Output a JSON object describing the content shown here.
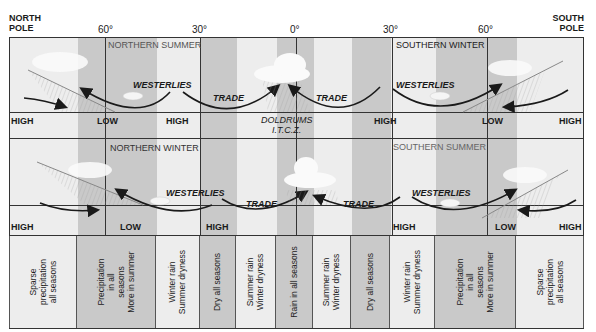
{
  "header": {
    "north_pole": "NORTH\nPOLE",
    "south_pole": "SOUTH\nPOLE",
    "latitudes": [
      "60°",
      "30°",
      "0°",
      "30°",
      "60°"
    ]
  },
  "top_panel": {
    "season_left": "NORTHERN SUMMER",
    "season_right": "SOUTHERN WINTER",
    "winds": [
      "WESTERLIES",
      "TRADE",
      "TRADE",
      "WESTERLIES"
    ]
  },
  "top_pressure_row": {
    "labels": [
      "HIGH",
      "LOW",
      "HIGH",
      "HIGH",
      "LOW",
      "HIGH"
    ],
    "doldrums": "DOLDRUMS",
    "itcz": "I.T.C.Z."
  },
  "bottom_panel": {
    "season_left": "NORTHERN WINTER",
    "season_right": "SOUTHERN SUMMER",
    "winds": [
      "WESTERLIES",
      "TRADE",
      "TRADE",
      "WESTERLIES"
    ]
  },
  "bottom_pressure_row": {
    "labels": [
      "HIGH",
      "LOW",
      "HIGH",
      "HIGH",
      "LOW",
      "HIGH"
    ]
  },
  "precipitation_zones": [
    {
      "text": "Sparse\nprecipitation\nall seasons",
      "shade": "light"
    },
    {
      "text": "Precipitation\nin all\nseasons\nMore in summer",
      "shade": "dark"
    },
    {
      "text": "Winter rain\nSummer dryness",
      "shade": "light"
    },
    {
      "text": "Dry all seasons",
      "shade": "dark"
    },
    {
      "text": "Summer rain\nWinter dryness",
      "shade": "light"
    },
    {
      "text": "Rain in all seasons",
      "shade": "dark"
    },
    {
      "text": "Summer rain\nWinter dryness",
      "shade": "light"
    },
    {
      "text": "Dry all seasons",
      "shade": "dark"
    },
    {
      "text": "Winter rain\nSummer dryness",
      "shade": "light"
    },
    {
      "text": "Precipitation\nin all\nseasons\nMore in summer",
      "shade": "dark"
    },
    {
      "text": "Sparse\nprecipitation\nall seasons",
      "shade": "light"
    }
  ],
  "colors": {
    "light_band": "#ededed",
    "dark_band": "#c9c9c9",
    "line": "#333333"
  }
}
